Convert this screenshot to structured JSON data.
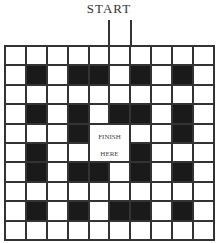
{
  "title": "START",
  "finish_label_top": "FINISH",
  "finish_label_bottom": "HERE",
  "colors": {
    "wall": "#1a1a1a",
    "open": "#ffffff",
    "line": "#333333"
  },
  "grid": {
    "rows": 10,
    "cols": 10,
    "finish_region": {
      "row_start": 4,
      "col_start": 4,
      "row_span": 2,
      "col_span": 2
    },
    "entry_col": 5,
    "black_cells": [
      [
        1,
        1
      ],
      [
        1,
        3
      ],
      [
        1,
        4
      ],
      [
        1,
        6
      ],
      [
        1,
        8
      ],
      [
        3,
        1
      ],
      [
        3,
        3
      ],
      [
        3,
        5
      ],
      [
        3,
        6
      ],
      [
        3,
        8
      ],
      [
        4,
        3
      ],
      [
        4,
        8
      ],
      [
        5,
        1
      ],
      [
        5,
        6
      ],
      [
        6,
        1
      ],
      [
        6,
        3
      ],
      [
        6,
        4
      ],
      [
        6,
        6
      ],
      [
        6,
        8
      ],
      [
        8,
        1
      ],
      [
        8,
        3
      ],
      [
        8,
        5
      ],
      [
        8,
        6
      ],
      [
        8,
        8
      ]
    ]
  }
}
